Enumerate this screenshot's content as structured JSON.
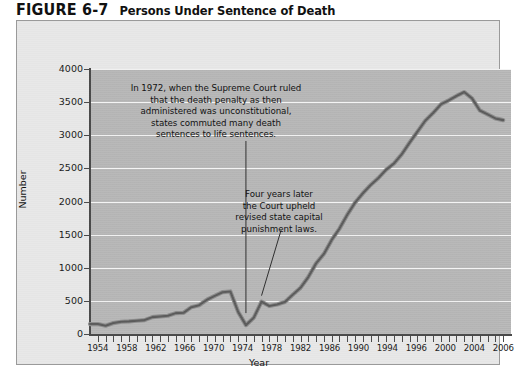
{
  "figure": {
    "number": "FIGURE 6-7",
    "title": "Persons Under Sentence of Death"
  },
  "axes": {
    "ylabel": "Number",
    "xlabel": "Year",
    "yticks": [
      "0",
      "500",
      "1000",
      "1500",
      "2000",
      "2500",
      "3000",
      "3500",
      "4000"
    ],
    "xticks": [
      "1954",
      "1958",
      "1962",
      "1966",
      "1970",
      "1974",
      "1978",
      "1982",
      "1986",
      "1990",
      "1994",
      "1996",
      "2000",
      "2004",
      "2006"
    ]
  },
  "annotations": {
    "first": "In 1972, when the Supreme Court ruled\nthat the death penalty as then\nadministered was unconstitutional,\nstates commuted many death\nsentences to life sentences.",
    "second": "Four years later\nthe Court upheld\nrevised state capital\npunishment laws."
  },
  "colors": {
    "panel_background": "#e8e8e8",
    "plot_background": "#b9b9b9",
    "gridline": "#f4f4f4",
    "axis": "#4a4a4a",
    "line_dark": "#5a5a5a",
    "line_light": "#8d8d8d",
    "text": "#111111"
  },
  "chart_data": {
    "type": "line",
    "title": "Persons Under Sentence of Death",
    "xlabel": "Year",
    "ylabel": "Number",
    "xlim": [
      1953,
      2007
    ],
    "ylim": [
      0,
      4000
    ],
    "grid": true,
    "legend": "none",
    "x": [
      1953,
      1954,
      1955,
      1956,
      1957,
      1958,
      1959,
      1960,
      1961,
      1962,
      1963,
      1964,
      1965,
      1966,
      1967,
      1968,
      1969,
      1970,
      1971,
      1972,
      1973,
      1974,
      1975,
      1976,
      1977,
      1978,
      1979,
      1980,
      1981,
      1982,
      1983,
      1984,
      1985,
      1986,
      1987,
      1988,
      1989,
      1990,
      1991,
      1992,
      1993,
      1994,
      1995,
      1996,
      1997,
      1998,
      1999,
      2000,
      2001,
      2002,
      2003,
      2004,
      2005,
      2006
    ],
    "values": [
      150,
      150,
      125,
      165,
      185,
      190,
      200,
      210,
      255,
      265,
      275,
      315,
      320,
      405,
      435,
      517,
      575,
      631,
      642,
      334,
      134,
      244,
      488,
      423,
      445,
      482,
      593,
      697,
      860,
      1066,
      1209,
      1420,
      1591,
      1800,
      1984,
      2124,
      2250,
      2356,
      2482,
      2575,
      2716,
      2890,
      3054,
      3219,
      3335,
      3465,
      3527,
      3593,
      3652,
      3557,
      3374,
      3315,
      3254,
      3228
    ],
    "series": [
      {
        "name": "Persons under sentence of death",
        "values": [
          150,
          150,
          125,
          165,
          185,
          190,
          200,
          210,
          255,
          265,
          275,
          315,
          320,
          405,
          435,
          517,
          575,
          631,
          642,
          334,
          134,
          244,
          488,
          423,
          445,
          482,
          593,
          697,
          860,
          1066,
          1209,
          1420,
          1591,
          1800,
          1984,
          2124,
          2250,
          2356,
          2482,
          2575,
          2716,
          2890,
          3054,
          3219,
          3335,
          3465,
          3527,
          3593,
          3652,
          3557,
          3374,
          3315,
          3254,
          3228
        ]
      }
    ],
    "annotations": [
      {
        "text": "In 1972, when the Supreme Court ruled that the death penalty as then administered was unconstitutional, states commuted many death sentences to life sentences.",
        "points_to_year": 1973
      },
      {
        "text": "Four years later the Court upheld revised state capital punishment laws.",
        "points_to_year": 1976
      }
    ]
  }
}
